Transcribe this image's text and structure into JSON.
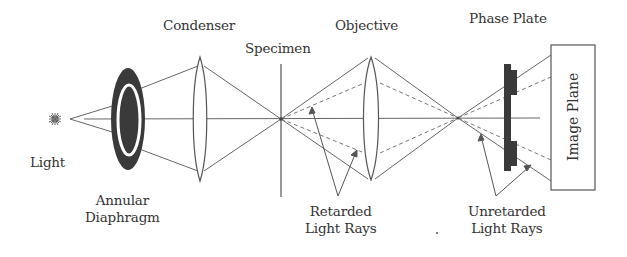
{
  "diagram": {
    "labels": {
      "light": "Light",
      "annular_diaphragm": [
        "Annular",
        "Diaphragm"
      ],
      "condenser": "Condenser",
      "specimen": "Specimen",
      "objective": "Objective",
      "phase_plate": "Phase Plate",
      "image_plane": "Image Plane",
      "retarded_rays": [
        "Retarded",
        "Light Rays"
      ],
      "unretarded_rays": [
        "Unretarded",
        "Light Rays"
      ]
    },
    "colors": {
      "line": "#555555",
      "dark_fill": "#3a3a3a",
      "text": "#333333",
      "background": "#ffffff"
    },
    "components": [
      {
        "id": "light-source",
        "icon": "sun-star-icon"
      },
      {
        "id": "annular-diaphragm",
        "shape": "dark ellipse with white ring"
      },
      {
        "id": "condenser-lens",
        "shape": "biconvex lens"
      },
      {
        "id": "specimen-plane",
        "shape": "vertical line"
      },
      {
        "id": "objective-lens",
        "shape": "biconvex lens"
      },
      {
        "id": "phase-plate",
        "shape": "dark plate with ring bumps"
      },
      {
        "id": "image-plane",
        "shape": "rectangle"
      }
    ]
  }
}
